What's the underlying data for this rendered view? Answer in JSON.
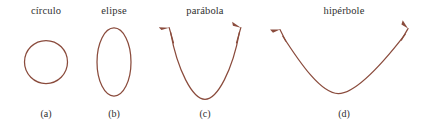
{
  "figure": {
    "background_color": "#ffffff",
    "stroke_color": "#8a4b3c",
    "text_color": "#2f2f2f",
    "panels": [
      {
        "id": "circulo",
        "title": "círculo",
        "caption": "(a)",
        "shape": "circle",
        "closed": true,
        "has_arrows": false
      },
      {
        "id": "elipse",
        "title": "elipse",
        "caption": "(b)",
        "shape": "ellipse",
        "closed": true,
        "has_arrows": false
      },
      {
        "id": "parabola",
        "title": "parábola",
        "caption": "(c)",
        "shape": "parabola",
        "closed": false,
        "has_arrows": true,
        "arrow_count": 2
      },
      {
        "id": "hiperbole",
        "title": "hipérbole",
        "caption": "(d)",
        "shape": "hyperbola-branch",
        "closed": false,
        "has_arrows": true,
        "arrow_count": 2
      }
    ]
  }
}
